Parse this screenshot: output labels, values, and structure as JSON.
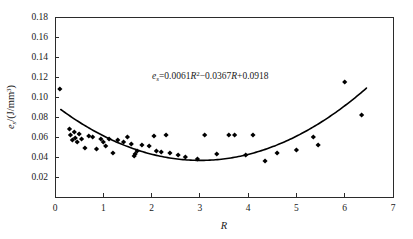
{
  "figure": {
    "background_color": "#ffffff",
    "foreground_color": "#000000"
  },
  "annotation": {
    "equation_full": "es=0.0061R2-0.0367R+0.0918",
    "equation_var": "e",
    "equation_sub": "s",
    "equation_part1": "=0.0061",
    "equation_r1": "R",
    "equation_exp": "2",
    "equation_part2": "−0.0367",
    "equation_r2": "R",
    "equation_part3": "+0.0918"
  },
  "axes": {
    "x": {
      "label": "R",
      "min": 0,
      "max": 7,
      "ticks": [
        0,
        1,
        2,
        3,
        4,
        5,
        6,
        7
      ],
      "tick_labels": [
        "0",
        "1",
        "2",
        "3",
        "4",
        "5",
        "6",
        "7"
      ],
      "grid": false
    },
    "y": {
      "label_var": "e",
      "label_sub": "s",
      "label_unit": "/(J/mm",
      "label_exp": "3",
      "label_close": ")",
      "label_full": "es/(J/mm3)",
      "min": 0,
      "max": 0.18,
      "ticks": [
        0.02,
        0.04,
        0.06,
        0.08,
        0.1,
        0.12,
        0.14,
        0.16,
        0.18
      ],
      "tick_labels": [
        "0.02",
        "0.04",
        "0.06",
        "0.08",
        "0.10",
        "0.12",
        "0.14",
        "0.16",
        "0.18"
      ],
      "grid": false
    }
  },
  "chart_data": {
    "type": "scatter",
    "title": "",
    "xlabel": "R",
    "ylabel": "es/(J/mm3)",
    "xlim": [
      0,
      7
    ],
    "ylim": [
      0,
      0.18
    ],
    "grid": false,
    "legend": "none",
    "annotations": [
      {
        "text": "es=0.0061R2-0.0367R+0.0918",
        "x": 2.6,
        "y": 0.123
      }
    ],
    "series": [
      {
        "name": "measured",
        "type": "scatter",
        "marker": "diamond",
        "color": "#000000",
        "points": [
          [
            0.1,
            0.108
          ],
          [
            0.3,
            0.068
          ],
          [
            0.32,
            0.062
          ],
          [
            0.36,
            0.057
          ],
          [
            0.4,
            0.065
          ],
          [
            0.42,
            0.059
          ],
          [
            0.46,
            0.055
          ],
          [
            0.5,
            0.063
          ],
          [
            0.55,
            0.058
          ],
          [
            0.62,
            0.049
          ],
          [
            0.7,
            0.061
          ],
          [
            0.78,
            0.06
          ],
          [
            0.86,
            0.048
          ],
          [
            0.95,
            0.058
          ],
          [
            1.0,
            0.055
          ],
          [
            1.05,
            0.051
          ],
          [
            1.12,
            0.058
          ],
          [
            1.2,
            0.044
          ],
          [
            1.3,
            0.057
          ],
          [
            1.42,
            0.055
          ],
          [
            1.5,
            0.06
          ],
          [
            1.58,
            0.053
          ],
          [
            1.64,
            0.041
          ],
          [
            1.66,
            0.043
          ],
          [
            1.7,
            0.046
          ],
          [
            1.8,
            0.052
          ],
          [
            1.95,
            0.051
          ],
          [
            2.05,
            0.061
          ],
          [
            2.1,
            0.046
          ],
          [
            2.2,
            0.045
          ],
          [
            2.3,
            0.062
          ],
          [
            2.38,
            0.044
          ],
          [
            2.55,
            0.042
          ],
          [
            2.7,
            0.04
          ],
          [
            2.95,
            0.038
          ],
          [
            3.1,
            0.062
          ],
          [
            3.35,
            0.043
          ],
          [
            3.6,
            0.062
          ],
          [
            3.72,
            0.062
          ],
          [
            3.95,
            0.042
          ],
          [
            4.1,
            0.062
          ],
          [
            4.35,
            0.036
          ],
          [
            4.6,
            0.044
          ],
          [
            5.0,
            0.047
          ],
          [
            5.35,
            0.06
          ],
          [
            5.45,
            0.052
          ],
          [
            6.0,
            0.115
          ],
          [
            6.35,
            0.082
          ]
        ]
      },
      {
        "name": "quadratic fit",
        "type": "line",
        "color": "#000000",
        "equation": "es=0.0061R2-0.0367R+0.0918",
        "coefficients": {
          "a": 0.0061,
          "b": -0.0367,
          "c": 0.0918
        },
        "x_range": [
          0.12,
          6.45
        ]
      }
    ]
  }
}
